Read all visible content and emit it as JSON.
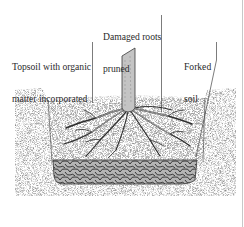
{
  "diagram": {
    "type": "planting-cross-section",
    "labels": {
      "damaged_roots_line1": "Damaged roots",
      "damaged_roots_line2": "pruned",
      "topsoil_line1": "Topsoil with organic",
      "topsoil_line2": "matter incorporated",
      "forked_line1": "Forked",
      "forked_line2": "soil"
    },
    "colors": {
      "soil_dark": "#7a7a7a",
      "topsoil": "#a8a8a8",
      "rubble": "#8c8c8c",
      "stem": "#c9c9c9",
      "roots": "#3a3a3a",
      "leader_line": "#444444",
      "frame_line": "#c8c8c8"
    }
  }
}
